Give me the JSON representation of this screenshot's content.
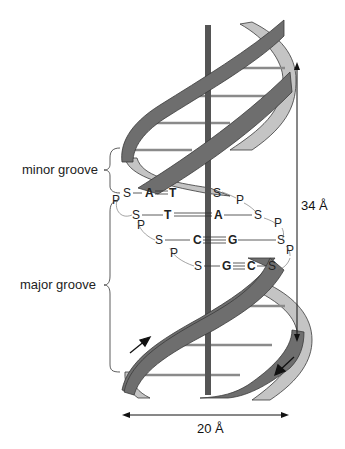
{
  "figure": {
    "type": "DNA double helix schematic",
    "colors": {
      "front_ribbon": "#6e6e6e",
      "back_ribbon": "#c4c4c4",
      "ribbon_edge": "#3a3a3a",
      "axis": "#555555",
      "rungs": "#8a8a8a",
      "text": "#222222"
    }
  },
  "labels": {
    "minor_groove": "minor groove",
    "major_groove": "major groove"
  },
  "dimensions": {
    "pitch": "34 Å",
    "diameter": "20 Å"
  },
  "backbone": {
    "sugar": "S",
    "phosphate": "P"
  },
  "base_pairs": [
    {
      "left": "A",
      "right": "T",
      "bond": "double"
    },
    {
      "left": "T",
      "right": "A",
      "bond": "double"
    },
    {
      "left": "C",
      "right": "G",
      "bond": "triple"
    },
    {
      "left": "G",
      "right": "C",
      "bond": "triple"
    }
  ]
}
